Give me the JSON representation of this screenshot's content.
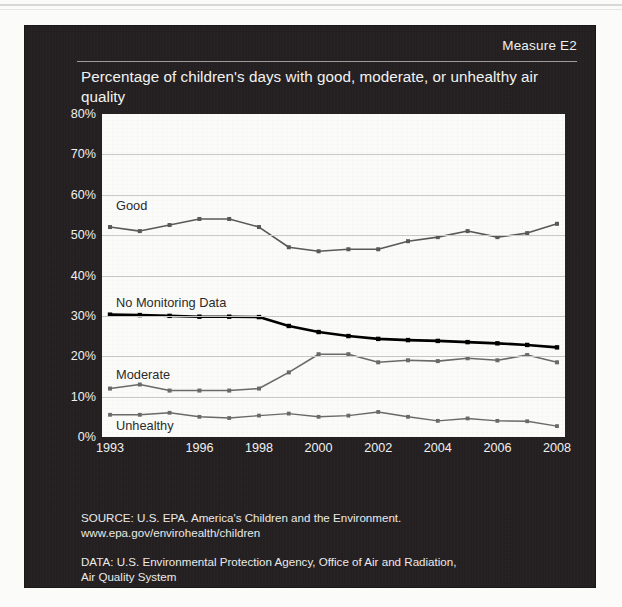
{
  "header": {
    "measure_label": "Measure E2",
    "title": "Percentage of children's days with good, moderate, or unhealthy air quality"
  },
  "notes": {
    "source_line1": "SOURCE: U.S. EPA. America's Children and the Environment.",
    "source_line2": "www.epa.gov/envirohealth/children",
    "data_line1": "DATA: U.S. Environmental Protection Agency, Office of Air and Radiation,",
    "data_line2": "Air Quality System"
  },
  "series_labels": {
    "good": "Good",
    "no_monitoring": "No Monitoring Data",
    "moderate": "Moderate",
    "unhealthy": "Unhealthy"
  },
  "colors": {
    "panel": "#231f20",
    "plot_background": "#fbfbf9",
    "gridline": "#c9c9c5",
    "good_line": "#595959",
    "no_monitoring_line": "#000000",
    "moderate_line": "#6a6a6a",
    "unhealthy_line": "#6a6a6a",
    "axis_text": "#f0f0ef",
    "title_text": "#f2f2f1"
  },
  "chart_data": {
    "type": "line",
    "title": "Percentage of children's days with good, moderate, or unhealthy air quality",
    "xlabel": "",
    "ylabel": "",
    "x": [
      1993,
      1994,
      1995,
      1996,
      1997,
      1998,
      1999,
      2000,
      2001,
      2002,
      2003,
      2004,
      2005,
      2006,
      2007,
      2008
    ],
    "xticks": [
      "1993",
      "1996",
      "1998",
      "2000",
      "2002",
      "2004",
      "2006",
      "2008"
    ],
    "xtick_values": [
      1993,
      1996,
      1998,
      2000,
      2002,
      2004,
      2006,
      2008
    ],
    "yticks": [
      "0%",
      "10%",
      "20%",
      "30%",
      "40%",
      "50%",
      "60%",
      "70%",
      "80%"
    ],
    "ytick_values": [
      0,
      10,
      20,
      30,
      40,
      50,
      60,
      70,
      80
    ],
    "ylim": [
      0,
      80
    ],
    "xlim": [
      1993,
      2008
    ],
    "grid": true,
    "legend": "inline-labels",
    "series": [
      {
        "name": "Good",
        "values": [
          52,
          51,
          52.5,
          54,
          54,
          52,
          47,
          46,
          46.5,
          46.5,
          48.5,
          49.5,
          51,
          49.5,
          50.5,
          49.5
        ]
      },
      {
        "name": "No Monitoring Data",
        "values": [
          30.3,
          30.2,
          30,
          29.8,
          29.8,
          29.7,
          27.5,
          26,
          25,
          24.3,
          24,
          23.8,
          23.5,
          23.2,
          22.8,
          22.2
        ]
      },
      {
        "name": "Moderate",
        "values": [
          12,
          13,
          11.5,
          11.5,
          11.5,
          12,
          16,
          20.5,
          20.5,
          18.5,
          19,
          18.8,
          19.5,
          19,
          20.3,
          18.5
        ]
      },
      {
        "name": "Unhealthy",
        "values": [
          5.5,
          5.5,
          6,
          5,
          4.7,
          5.3,
          5.8,
          5,
          5.3,
          6.2,
          5,
          4,
          4.6,
          4,
          3.9,
          2.7
        ]
      }
    ],
    "final_good_value": 52.8
  }
}
